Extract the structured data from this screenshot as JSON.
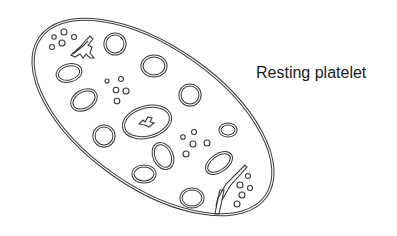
{
  "figure": {
    "label": "Resting platelet",
    "line_color": "#3a3a3a",
    "background": "#ffffff"
  },
  "components": {
    "outer_membrane": "platelet-membrane",
    "granules_large_count": 14,
    "dense_body_clusters": 4,
    "central_organelle": "mitochondrion",
    "tubular_systems": 2
  }
}
